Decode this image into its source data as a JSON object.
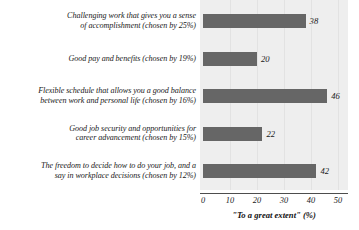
{
  "chart_data": {
    "type": "bar",
    "orientation": "horizontal",
    "title": "",
    "subtitle": "",
    "xlabel": "\"To a great extent\" (%)",
    "ylabel": "",
    "xlim": [
      0,
      50
    ],
    "xticks": [
      0,
      10,
      20,
      30,
      40,
      50
    ],
    "xtick_labels": [
      "0",
      "10",
      "20",
      "30",
      "40",
      "50"
    ],
    "grid": true,
    "legend": false,
    "categories": [
      "Challenging work that gives you a sense of accomplishment (chosen by 25%)",
      "Good pay and benefits (chosen by 19%)",
      "Flexible schedule that allows you a good balance between work and personal life (chosen by 16%)",
      "Good job security and opportunities for career advancement (chosen by 15%)",
      "The freedom to decide how to do your job, and a say in workplace decisions (chosen by 12%)"
    ],
    "values": [
      38,
      20,
      46,
      22,
      42
    ],
    "value_labels": [
      "38",
      "20",
      "46",
      "22",
      "42"
    ],
    "bar_color": "#666666",
    "plot_background": "#eeeeee",
    "gridline_color": "#e2e2e2",
    "axis_color": "#4d4d4d"
  },
  "rows": [
    {
      "label_line1": "Challenging work that gives you a sense",
      "label_line2": "of accomplishment (chosen by 25%)",
      "value": 38,
      "value_label": "38"
    },
    {
      "label_line1": "Good pay and benefits (chosen by 19%)",
      "label_line2": "",
      "value": 20,
      "value_label": "20"
    },
    {
      "label_line1": "Flexible schedule that allows you a good balance",
      "label_line2": "between work and personal life (chosen by 16%)",
      "value": 46,
      "value_label": "46"
    },
    {
      "label_line1": "Good job security and opportunities for",
      "label_line2": "career advancement (chosen by 15%)",
      "value": 22,
      "value_label": "22"
    },
    {
      "label_line1": "The freedom to decide how to do your job, and a",
      "label_line2": "say in workplace decisions (chosen by 12%)",
      "value": 42,
      "value_label": "42"
    }
  ],
  "axis": {
    "ticks": [
      "0",
      "10",
      "20",
      "30",
      "40",
      "50"
    ],
    "title": "\"To a great extent\" (%)"
  }
}
